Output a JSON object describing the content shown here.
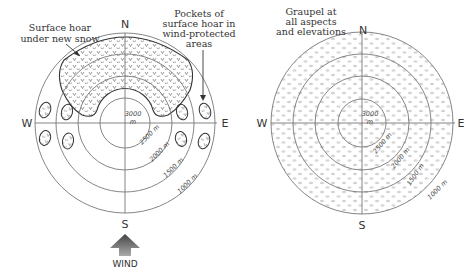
{
  "left_diagram": {
    "title": "Surface hoar distribution",
    "directions": {
      "north": "N",
      "south": "S",
      "west": "W",
      "east": "E"
    },
    "elevation_labels": {
      "inner_top": "3000",
      "inner_unit": "m",
      "ring2": "2500 m",
      "ring3": "2000 m",
      "ring4": "1500 m",
      "ring5": "1000 m"
    },
    "annotation_left": [
      "Surface hoar",
      "under new snow"
    ],
    "annotation_right": [
      "Pockets of",
      "surface hoar in",
      "wind-protected",
      "areas"
    ],
    "wind_label": "WIND",
    "hoar_symbol": "v"
  },
  "right_diagram": {
    "directions": {
      "north": "N",
      "south": "S",
      "west": "W",
      "east": "E"
    },
    "elevation_labels": {
      "inner_top": "3000",
      "inner_unit": "m",
      "ring2": "2500 m",
      "ring3": "2000 m",
      "ring4": "1500 m",
      "ring5": "1000 m"
    },
    "annotation": [
      "Graupel at",
      "all aspects",
      "and elevations"
    ]
  }
}
